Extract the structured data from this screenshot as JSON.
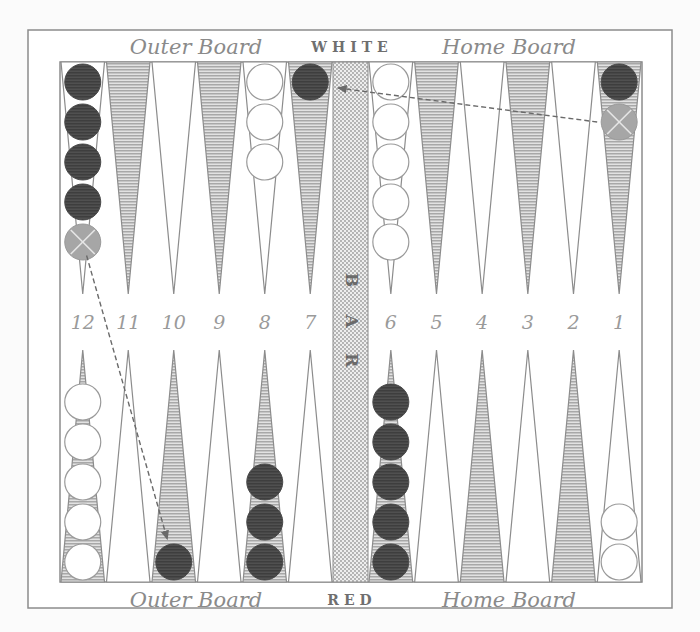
{
  "board": {
    "top_side_label": "WHITE",
    "bottom_side_label": "RED",
    "bar_label": [
      "B",
      "A",
      "R"
    ],
    "top_left_quadrant_label": "Outer Board",
    "top_right_quadrant_label": "Home Board",
    "bottom_left_quadrant_label": "Outer Board",
    "bottom_right_quadrant_label": "Home Board",
    "point_numbers": [
      "12",
      "11",
      "10",
      "9",
      "8",
      "7",
      "6",
      "5",
      "4",
      "3",
      "2",
      "1"
    ]
  },
  "colors": {
    "dark_checker": "#4a4a4a",
    "ghost_checker": "#9a9a9a",
    "white_checker": "#ffffff",
    "line": "#8c8c8c",
    "shaded_point": "#b4b4b4",
    "bar_fill": "#d6d6d6"
  },
  "checkers": {
    "top": [
      {
        "point": 12,
        "color": "dark",
        "count": 4,
        "ghost": 1
      },
      {
        "point": 8,
        "color": "white",
        "count": 3,
        "ghost": 0
      },
      {
        "point": 7,
        "color": "dark",
        "count": 1,
        "ghost": 0
      },
      {
        "point": 6,
        "color": "white",
        "count": 5,
        "ghost": 0
      },
      {
        "point": 1,
        "color": "dark",
        "count": 1,
        "ghost": 1
      }
    ],
    "bottom": [
      {
        "point": 12,
        "color": "white",
        "count": 5,
        "ghost": 0
      },
      {
        "point": 10,
        "color": "dark",
        "count": 1,
        "ghost": 0
      },
      {
        "point": 8,
        "color": "dark",
        "count": 3,
        "ghost": 0
      },
      {
        "point": 6,
        "color": "dark",
        "count": 5,
        "ghost": 0
      },
      {
        "point": 1,
        "color": "white",
        "count": 2,
        "ghost": 0
      }
    ]
  },
  "moves": [
    {
      "from": {
        "side": "top",
        "point": 1
      },
      "to": {
        "side": "top",
        "point": 7
      }
    },
    {
      "from": {
        "side": "top",
        "point": 12
      },
      "to": {
        "side": "bottom",
        "point": 10
      }
    }
  ]
}
